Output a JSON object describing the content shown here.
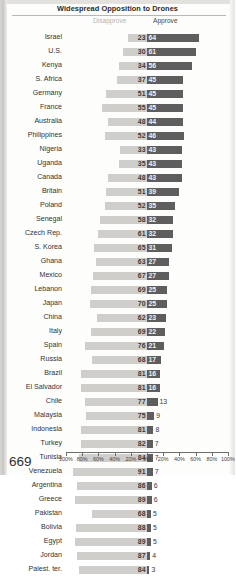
{
  "page": {
    "number": "669"
  },
  "header": {
    "title": "Widespread Opposition to Drones"
  },
  "legend": {
    "disapprove_label": "Disapprove",
    "approve_label": "Approve",
    "disapprove_color": "#cfcecb",
    "approve_color": "#5e5e5e"
  },
  "axis": {
    "ticks": [
      "100%",
      "80%",
      "60%",
      "40%",
      "20%",
      "0%",
      "20%",
      "40%",
      "60%",
      "80%",
      "100%"
    ]
  },
  "chart_data": {
    "type": "bar",
    "subtype": "diverging-horizontal",
    "title": "Widespread Opposition to Drones",
    "xlabel": "",
    "ylabel": "",
    "xlim": [
      -100,
      100
    ],
    "grid": false,
    "legend_position": "top",
    "series": [
      {
        "name": "Disapprove",
        "direction": "left",
        "color": "#cfcecb"
      },
      {
        "name": "Approve",
        "direction": "right",
        "color": "#5e5e5e"
      }
    ],
    "categories": [
      "Israel",
      "U.S.",
      "Kenya",
      "S. Africa",
      "Germany",
      "France",
      "Australia",
      "Philippines",
      "Nigeria",
      "Uganda",
      "Canada",
      "Britain",
      "Poland",
      "Senegal",
      "Czech Rep.",
      "S. Korea",
      "Ghana",
      "Mexico",
      "Lebanon",
      "Japan",
      "China",
      "Italy",
      "Spain",
      "Russia",
      "Brazil",
      "El Salvador",
      "Chile",
      "Malaysia",
      "Indonesia",
      "Turkey",
      "Tunisia",
      "Venezuela",
      "Argentina",
      "Greece",
      "Pakistan",
      "Bolivia",
      "Egypt",
      "Jordan",
      "Palest. ter."
    ],
    "disapprove": [
      23,
      30,
      34,
      37,
      51,
      55,
      48,
      52,
      33,
      35,
      48,
      51,
      52,
      58,
      61,
      65,
      63,
      67,
      69,
      70,
      62,
      69,
      76,
      68,
      81,
      81,
      77,
      75,
      81,
      82,
      84,
      91,
      86,
      89,
      68,
      88,
      89,
      87,
      84
    ],
    "approve": [
      64,
      61,
      56,
      45,
      45,
      45,
      44,
      46,
      43,
      43,
      43,
      39,
      35,
      32,
      32,
      31,
      27,
      27,
      25,
      25,
      23,
      22,
      21,
      17,
      16,
      16,
      13,
      9,
      8,
      7,
      7,
      7,
      6,
      6,
      5,
      5,
      5,
      4,
      3
    ]
  },
  "rows": [
    {
      "label": "Israel",
      "disapprove": 23,
      "approve": 64
    },
    {
      "label": "U.S.",
      "disapprove": 30,
      "approve": 61
    },
    {
      "label": "Kenya",
      "disapprove": 34,
      "approve": 56
    },
    {
      "label": "S. Africa",
      "disapprove": 37,
      "approve": 45
    },
    {
      "label": "Germany",
      "disapprove": 51,
      "approve": 45
    },
    {
      "label": "France",
      "disapprove": 55,
      "approve": 45
    },
    {
      "label": "Australia",
      "disapprove": 48,
      "approve": 44
    },
    {
      "label": "Philippines",
      "disapprove": 52,
      "approve": 46
    },
    {
      "label": "Nigeria",
      "disapprove": 33,
      "approve": 43
    },
    {
      "label": "Uganda",
      "disapprove": 35,
      "approve": 43
    },
    {
      "label": "Canada",
      "disapprove": 48,
      "approve": 43
    },
    {
      "label": "Britain",
      "disapprove": 51,
      "approve": 39
    },
    {
      "label": "Poland",
      "disapprove": 52,
      "approve": 35
    },
    {
      "label": "Senegal",
      "disapprove": 58,
      "approve": 32
    },
    {
      "label": "Czech Rep.",
      "disapprove": 61,
      "approve": 32
    },
    {
      "label": "S. Korea",
      "disapprove": 65,
      "approve": 31
    },
    {
      "label": "Ghana",
      "disapprove": 63,
      "approve": 27
    },
    {
      "label": "Mexico",
      "disapprove": 67,
      "approve": 27
    },
    {
      "label": "Lebanon",
      "disapprove": 69,
      "approve": 25
    },
    {
      "label": "Japan",
      "disapprove": 70,
      "approve": 25
    },
    {
      "label": "China",
      "disapprove": 62,
      "approve": 23
    },
    {
      "label": "Italy",
      "disapprove": 69,
      "approve": 22
    },
    {
      "label": "Spain",
      "disapprove": 76,
      "approve": 21
    },
    {
      "label": "Russia",
      "disapprove": 68,
      "approve": 17
    },
    {
      "label": "Brazil",
      "disapprove": 81,
      "approve": 16
    },
    {
      "label": "El Salvador",
      "disapprove": 81,
      "approve": 16
    },
    {
      "label": "Chile",
      "disapprove": 77,
      "approve": 13
    },
    {
      "label": "Malaysia",
      "disapprove": 75,
      "approve": 9
    },
    {
      "label": "Indonesia",
      "disapprove": 81,
      "approve": 8
    },
    {
      "label": "Turkey",
      "disapprove": 82,
      "approve": 7
    },
    {
      "label": "Tunisia",
      "disapprove": 84,
      "approve": 7
    },
    {
      "label": "Venezuela",
      "disapprove": 91,
      "approve": 7
    },
    {
      "label": "Argentina",
      "disapprove": 86,
      "approve": 6
    },
    {
      "label": "Greece",
      "disapprove": 89,
      "approve": 6
    },
    {
      "label": "Pakistan",
      "disapprove": 68,
      "approve": 5
    },
    {
      "label": "Bolivia",
      "disapprove": 88,
      "approve": 5
    },
    {
      "label": "Egypt",
      "disapprove": 89,
      "approve": 5
    },
    {
      "label": "Jordan",
      "disapprove": 87,
      "approve": 4
    },
    {
      "label": "Palest. ter.",
      "disapprove": 84,
      "approve": 3
    }
  ]
}
